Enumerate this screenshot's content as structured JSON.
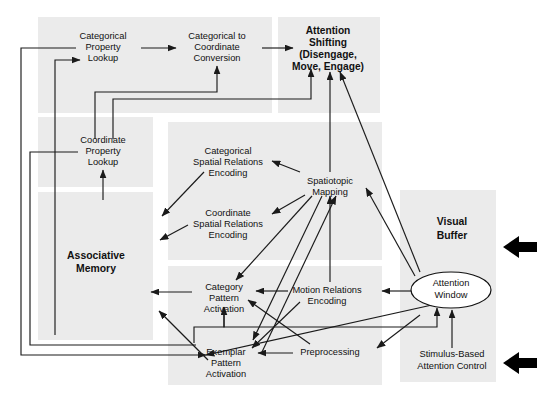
{
  "figure": {
    "type": "diagram",
    "subtype": "box-and-arrow cognitive architecture flowchart",
    "background_color": "#ffffff",
    "panel_color": "#ebebeb",
    "line_color": "#1a1a1a"
  },
  "panels": [
    {
      "id": "panel-top-left",
      "label": "",
      "x": 38,
      "y": 17,
      "w": 234,
      "h": 96
    },
    {
      "id": "panel-attention-shifting",
      "label": "",
      "x": 278,
      "y": 17,
      "w": 102,
      "h": 96
    },
    {
      "id": "panel-spatial-encoding",
      "label": "",
      "x": 168,
      "y": 122,
      "w": 214,
      "h": 138
    },
    {
      "id": "panel-coordinate-lookup",
      "label": "",
      "x": 38,
      "y": 117,
      "w": 115,
      "h": 70
    },
    {
      "id": "panel-associative-memory",
      "label": "",
      "x": 38,
      "y": 192,
      "w": 115,
      "h": 148
    },
    {
      "id": "panel-bottom-middle",
      "label": "",
      "x": 168,
      "y": 266,
      "w": 214,
      "h": 119
    },
    {
      "id": "panel-visual-buffer",
      "label": "",
      "x": 400,
      "y": 190,
      "w": 96,
      "h": 192
    }
  ],
  "panel_labels": [
    {
      "id": "associative-memory",
      "line1": "Associative",
      "line2": "Memory",
      "x": 96,
      "y": 262
    },
    {
      "id": "visual-buffer",
      "line1": "Visual",
      "line2": "Buffer",
      "x": 452,
      "y": 228
    }
  ],
  "nodes": [
    {
      "id": "categorical-property-lookup",
      "lines": [
        "Categorical",
        "Property",
        "Lookup"
      ],
      "x": 103,
      "y": 48,
      "bold": false
    },
    {
      "id": "categorical-to-coordinate-conversion",
      "lines": [
        "Categorical to",
        "Coordinate",
        "Conversion"
      ],
      "x": 217,
      "y": 48,
      "bold": false
    },
    {
      "id": "attention-shifting",
      "lines": [
        "Attention",
        "Shifting",
        "(Disengage,",
        "Move, Engage)"
      ],
      "x": 328,
      "y": 48,
      "bold": true
    },
    {
      "id": "coordinate-property-lookup",
      "lines": [
        "Coordinate",
        "Property",
        "Lookup"
      ],
      "x": 103,
      "y": 152,
      "bold": false
    },
    {
      "id": "categorical-spatial-relations-encoding",
      "lines": [
        "Categorical",
        "Spatial Relations",
        "Encoding"
      ],
      "x": 228,
      "y": 161,
      "bold": false
    },
    {
      "id": "coordinate-spatial-relations-encoding",
      "lines": [
        "Coordinate",
        "Spatial Relations",
        "Encoding"
      ],
      "x": 228,
      "y": 223,
      "bold": false
    },
    {
      "id": "spatiotopic-mapping",
      "lines": [
        "Spatiotopic",
        "Mapping"
      ],
      "x": 330,
      "y": 182,
      "bold": false
    },
    {
      "id": "category-pattern-activation",
      "lines": [
        "Category",
        "Pattern",
        "Activation"
      ],
      "x": 224,
      "y": 292,
      "bold": false
    },
    {
      "id": "motion-relations-encoding",
      "lines": [
        "Motion Relations",
        "Encoding"
      ],
      "x": 327,
      "y": 292,
      "bold": false
    },
    {
      "id": "exemplar-pattern-activation",
      "lines": [
        "Exemplar",
        "Pattern",
        "Activation"
      ],
      "x": 226,
      "y": 353,
      "bold": false
    },
    {
      "id": "preprocessing",
      "lines": [
        "Preprocessing"
      ],
      "x": 330,
      "y": 353,
      "bold": false
    },
    {
      "id": "stimulus-based-attention-control",
      "lines": [
        "Stimulus-Based",
        "Attention Control"
      ],
      "x": 452,
      "y": 360,
      "bold": false
    }
  ],
  "ellipses": [
    {
      "id": "attention-window",
      "lines": [
        "Attention",
        "Window"
      ],
      "cx": 451,
      "cy": 290,
      "rx": 40,
      "ry": 18
    }
  ],
  "input_arrows": [
    {
      "id": "visual-input-arrow-top",
      "x": 500,
      "y": 242
    },
    {
      "id": "visual-input-arrow-bottom",
      "x": 500,
      "y": 358
    }
  ],
  "edges": [
    {
      "from": "categorical-property-lookup",
      "to": "categorical-to-coordinate-conversion"
    },
    {
      "from": "categorical-to-coordinate-conversion",
      "to": "attention-shifting"
    },
    {
      "from": "spatiotopic-mapping",
      "to": "categorical-spatial-relations-encoding"
    },
    {
      "from": "spatiotopic-mapping",
      "to": "coordinate-spatial-relations-encoding"
    },
    {
      "from": "categorical-spatial-relations-encoding",
      "to": "associative-memory"
    },
    {
      "from": "coordinate-spatial-relations-encoding",
      "to": "associative-memory"
    },
    {
      "from": "spatiotopic-mapping",
      "to": "attention-shifting"
    },
    {
      "from": "attention-window",
      "to": "spatiotopic-mapping"
    },
    {
      "from": "attention-window",
      "to": "attention-shifting"
    },
    {
      "from": "spatiotopic-mapping",
      "to": "category-pattern-activation"
    },
    {
      "from": "spatiotopic-mapping",
      "to": "exemplar-pattern-activation"
    },
    {
      "from": "exemplar-pattern-activation",
      "to": "spatiotopic-mapping"
    },
    {
      "from": "motion-relations-encoding",
      "to": "spatiotopic-mapping"
    },
    {
      "from": "attention-window",
      "to": "motion-relations-encoding"
    },
    {
      "from": "motion-relations-encoding",
      "to": "category-pattern-activation"
    },
    {
      "from": "preprocessing",
      "to": "exemplar-pattern-activation"
    },
    {
      "from": "preprocessing",
      "to": "category-pattern-activation"
    },
    {
      "from": "attention-window",
      "to": "preprocessing"
    },
    {
      "from": "category-pattern-activation",
      "to": "associative-memory"
    },
    {
      "from": "exemplar-pattern-activation",
      "to": "associative-memory"
    },
    {
      "from": "exemplar-pattern-activation",
      "to": "category-pattern-activation"
    },
    {
      "from": "stimulus-based-attention-control",
      "to": "attention-window"
    },
    {
      "from": "attention-window",
      "to": "exemplar-pattern-activation"
    },
    {
      "from": "associative-memory",
      "to": "categorical-property-lookup"
    },
    {
      "from": "associative-memory",
      "to": "coordinate-property-lookup"
    },
    {
      "from": "coordinate-property-lookup",
      "to": "categorical-to-coordinate-conversion"
    },
    {
      "from": "coordinate-property-lookup",
      "to": "attention-shifting"
    },
    {
      "from": "category-pattern-activation",
      "to": "attention-window"
    }
  ]
}
